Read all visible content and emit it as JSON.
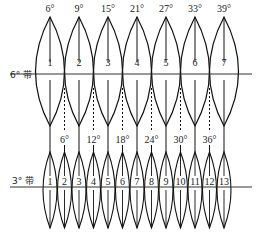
{
  "diagram": {
    "six_degree_band": {
      "label": "6° 带",
      "central_meridians": [
        "3°",
        "9°",
        "15°",
        "21°",
        "27°",
        "33°",
        "39°"
      ],
      "top_labels": [
        "6°",
        "9°",
        "15°",
        "21°",
        "27°",
        "33°",
        "39°"
      ],
      "zone_numbers": [
        "1",
        "2",
        "3",
        "4",
        "5",
        "6",
        "7"
      ]
    },
    "three_degree_band": {
      "label": "3° 带",
      "boundary_labels": [
        "6°",
        "12°",
        "18°",
        "24°",
        "30°",
        "36°"
      ],
      "zone_numbers": [
        "1",
        "2",
        "3",
        "4",
        "5",
        "6",
        "7",
        "8",
        "9",
        "10",
        "11",
        "12",
        "13"
      ]
    },
    "colors": {
      "stroke": "#111111",
      "background": "#ffffff"
    }
  }
}
